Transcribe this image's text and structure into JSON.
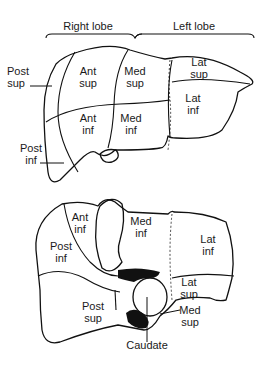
{
  "figure": {
    "top_view": {
      "lobe_headers": [
        {
          "id": "right",
          "label": "Right lobe"
        },
        {
          "id": "left",
          "label": "Left lobe"
        }
      ],
      "segments": [
        {
          "id": "post-sup",
          "line1": "Post",
          "line2": "sup"
        },
        {
          "id": "ant-sup",
          "line1": "Ant",
          "line2": "sup"
        },
        {
          "id": "med-sup",
          "line1": "Med",
          "line2": "sup"
        },
        {
          "id": "lat-sup",
          "line1": "Lat",
          "line2": "sup"
        },
        {
          "id": "lat-inf",
          "line1": "Lat",
          "line2": "inf"
        },
        {
          "id": "ant-inf",
          "line1": "Ant",
          "line2": "inf"
        },
        {
          "id": "med-inf",
          "line1": "Med",
          "line2": "inf"
        },
        {
          "id": "post-inf",
          "line1": "Post",
          "line2": "inf"
        }
      ]
    },
    "bottom_view": {
      "segments": [
        {
          "id": "ant-inf",
          "line1": "Ant",
          "line2": "inf"
        },
        {
          "id": "med-inf",
          "line1": "Med",
          "line2": "inf"
        },
        {
          "id": "lat-inf",
          "line1": "Lat",
          "line2": "inf"
        },
        {
          "id": "post-inf",
          "line1": "Post",
          "line2": "inf"
        },
        {
          "id": "lat-sup",
          "line1": "Lat",
          "line2": "sup"
        },
        {
          "id": "post-sup",
          "line1": "Post",
          "line2": "sup"
        },
        {
          "id": "med-sup",
          "line1": "Med",
          "line2": "sup"
        }
      ],
      "caudate_label": "Caudate"
    }
  }
}
